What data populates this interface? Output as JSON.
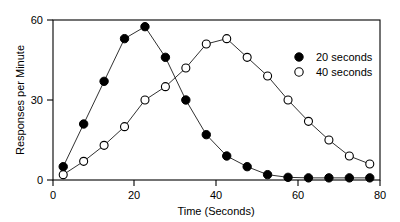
{
  "chart_data": {
    "type": "line",
    "title": "",
    "subtitle": "",
    "xlabel": "Time (Seconds)",
    "ylabel": "Responses per Minute",
    "xlim": [
      0,
      80
    ],
    "ylim": [
      0,
      60
    ],
    "xticks": [
      0,
      20,
      40,
      60,
      80
    ],
    "yticks": [
      0,
      30,
      60
    ],
    "xtick_labels": [
      "0",
      "20",
      "40",
      "60",
      "80"
    ],
    "ytick_labels": [
      "0",
      "30",
      "60"
    ],
    "grid": false,
    "legend_position": "upper-right-inside",
    "series": [
      {
        "name": "20 seconds",
        "marker": "filled-circle",
        "marker_fill": "#000000",
        "marker_edge": "#000000",
        "line_color": "#1a1a1a",
        "x": [
          2.5,
          7.5,
          12.5,
          17.5,
          22.5,
          27.5,
          32.5,
          37.5,
          42.5,
          47.5,
          52.5,
          57.5,
          62.5,
          67.5,
          72.5,
          77.5
        ],
        "y": [
          5,
          21,
          37,
          53,
          57.5,
          46,
          30,
          17,
          9,
          5,
          2,
          1,
          0.8,
          0.8,
          0.8,
          0.8
        ]
      },
      {
        "name": "40 seconds",
        "marker": "open-circle",
        "marker_fill": "#ffffff",
        "marker_edge": "#000000",
        "line_color": "#1a1a1a",
        "x": [
          2.5,
          7.5,
          12.5,
          17.5,
          22.5,
          27.5,
          32.5,
          37.5,
          42.5,
          47.5,
          52.5,
          57.5,
          62.5,
          67.5,
          72.5,
          77.5
        ],
        "y": [
          2,
          7,
          13,
          20,
          30,
          35,
          42,
          51,
          53,
          46,
          39,
          30,
          22,
          15,
          9,
          6
        ]
      }
    ]
  },
  "legend": {
    "entries": [
      {
        "label": "20 seconds",
        "marker": "filled-circle"
      },
      {
        "label": "40 seconds",
        "marker": "open-circle"
      }
    ]
  },
  "axes": {
    "y_title": "Responses per Minute",
    "x_title": "Time (Seconds)",
    "ytick_0": "0",
    "ytick_1": "30",
    "ytick_2": "60",
    "xtick_0": "0",
    "xtick_1": "20",
    "xtick_2": "40",
    "xtick_3": "60",
    "xtick_4": "80"
  },
  "colors": {
    "ink": "#000000",
    "line": "#1a1a1a",
    "background": "#ffffff"
  }
}
